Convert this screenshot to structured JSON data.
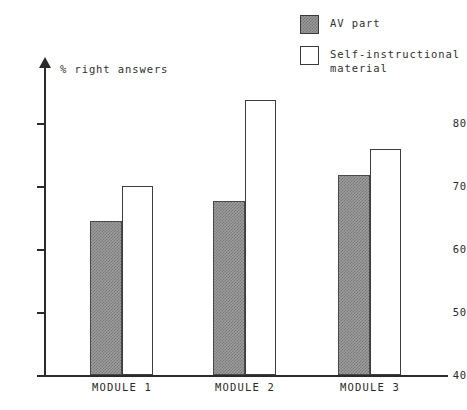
{
  "chart_data": {
    "type": "bar",
    "title": "",
    "subtitle": "",
    "xlabel": "",
    "ylabel": "% right answers",
    "ylim": [
      40,
      88
    ],
    "yticks": [
      40,
      50,
      60,
      70,
      80
    ],
    "ytick_labels": [
      "40",
      "50",
      "60",
      "70",
      "80"
    ],
    "grid": false,
    "legend_position": "top-right",
    "categories": [
      "MODULE 1",
      "MODULE 2",
      "MODULE 3"
    ],
    "series": [
      {
        "name": "AV part",
        "color": "#9d9d9d",
        "pattern": "checker-gray",
        "values": [
          64.5,
          67.6,
          71.7
        ]
      },
      {
        "name": "Self-instructional material",
        "color": "#ffffff",
        "pattern": "hollow",
        "values": [
          70.0,
          83.7,
          75.8
        ]
      }
    ]
  },
  "legend": {
    "items": [
      {
        "label": "AV part",
        "swatch": "filled-gray-swatch"
      },
      {
        "label": "Self-instructional\nmaterial",
        "swatch": "hollow-white-swatch"
      }
    ]
  },
  "axes": {
    "y_title": "% right answers",
    "y_tick_labels": [
      "80",
      "70",
      "60",
      "50",
      "40"
    ],
    "x_tick_labels": [
      "MODULE 1",
      "MODULE 2",
      "MODULE 3"
    ]
  }
}
